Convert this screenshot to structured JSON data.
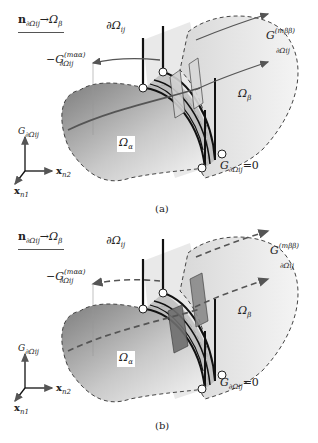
{
  "figure": {
    "panels": [
      {
        "id": "a",
        "caption": "(a)",
        "legend_normal": {
          "symbol": "n",
          "subscript": "∂Ωij",
          "arrow": "→",
          "target": "Ω",
          "target_sub": "β"
        },
        "interface_label": {
          "symbol": "∂Ω",
          "subscript": "ij"
        },
        "neg_flux_label": {
          "prefix": "−G",
          "superscript": "(mαα)",
          "subscript": "∂Ωij"
        },
        "pos_flux_label": {
          "prefix": "G",
          "superscript": "(mββ)",
          "subscript": "∂Ωij"
        },
        "domain_alpha": {
          "symbol": "Ω",
          "subscript": "α"
        },
        "domain_beta": {
          "symbol": "Ω",
          "subscript": "β"
        },
        "zero_label": {
          "prefix": "G",
          "subscript": "∂Ωij",
          "suffix": "=0"
        },
        "axes": {
          "vertical": {
            "symbol": "G",
            "subscript": "∂Ωij"
          },
          "horizontal": {
            "symbol": "x",
            "subscript": "n2"
          },
          "diagonal": {
            "symbol": "x",
            "subscript": "n1"
          }
        },
        "flux_arrow_style": "solid"
      },
      {
        "id": "b",
        "caption": "(b)",
        "legend_normal": {
          "symbol": "n",
          "subscript": "∂Ωij",
          "arrow": "→",
          "target": "Ω",
          "target_sub": "β"
        },
        "interface_label": {
          "symbol": "∂Ω",
          "subscript": "ij"
        },
        "neg_flux_label": {
          "prefix": "−G",
          "superscript": "(mαα)",
          "subscript": "∂Ωij"
        },
        "pos_flux_label": {
          "prefix": "G",
          "superscript": "(mββ)",
          "subscript": "∂Ωij"
        },
        "domain_alpha": {
          "symbol": "Ω",
          "subscript": "α"
        },
        "domain_beta": {
          "symbol": "Ω",
          "subscript": "β"
        },
        "zero_label": {
          "prefix": "G",
          "subscript": "∂Ωij",
          "suffix": "=0"
        },
        "axes": {
          "vertical": {
            "symbol": "G",
            "subscript": "∂Ωij"
          },
          "horizontal": {
            "symbol": "x",
            "subscript": "n2"
          },
          "diagonal": {
            "symbol": "x",
            "subscript": "n1"
          }
        },
        "flux_arrow_style": "dashed"
      }
    ],
    "colors": {
      "surface_dark": "#8a8a8a",
      "surface_light": "#f2f2f2",
      "wall": "#c8c8c8",
      "wall_dark": "#6e6e6e",
      "line": "#111111",
      "arrow": "#555555"
    }
  }
}
